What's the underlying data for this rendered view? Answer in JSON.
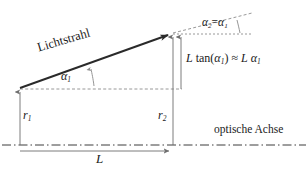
{
  "figure": {
    "language": "de",
    "background_color": "#ffffff",
    "line_color": "#3c3c3c",
    "text_color": "#1a1a1a",
    "width": 308,
    "height": 173
  },
  "labels": {
    "ray_name": "Lichtstrahl",
    "angle_in": "α",
    "angle_in_sub": "1",
    "angle_out_equation_lhs": "α",
    "angle_out_sub": "2",
    "equals": "=",
    "angle_out_equation_rhs": "α",
    "angle_out_rhs_sub": "1",
    "height_start": "r",
    "height_start_sub": "1",
    "height_end": "r",
    "height_end_sub": "2",
    "optical_axis": "optische Achse",
    "distance": "L",
    "relation_L": "L",
    "relation_tan": "tan(",
    "relation_alpha": "α",
    "relation_alpha_sub": "1",
    "relation_close": ")",
    "relation_approx": "≈",
    "relation_L2": "L",
    "relation_alpha2": "α",
    "relation_alpha2_sub": "1"
  },
  "geometry": {
    "ray_start": [
      20,
      88
    ],
    "ray_end": [
      173,
      33
    ],
    "ray_extension_end": [
      252,
      13
    ],
    "axis_y": 145,
    "axis_x_start": 2,
    "axis_x_end": 306,
    "vertical_r1_x": 20,
    "vertical_r2_x": 173,
    "vertical_ltan_x": 181,
    "dashed_horizontal_y": 89,
    "dotted_upper_y": 34,
    "dimension_line_y": 151,
    "L_value_px": 153
  },
  "annotations": {
    "relation_text": "L tan(α1) ≈ L α1",
    "angle_identity": "α2 = α1"
  }
}
